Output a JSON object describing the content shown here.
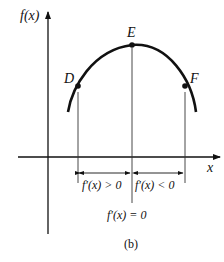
{
  "figure": {
    "caption": "(b)",
    "y_axis_label": "f(x)",
    "x_axis_label": "x",
    "points": [
      {
        "name": "D",
        "label": "D"
      },
      {
        "name": "E",
        "label": "E"
      },
      {
        "name": "F",
        "label": "F"
      }
    ],
    "intervals": {
      "left": "f′(x) > 0",
      "right": "f′(x) < 0"
    },
    "critical_label": "f′(x) = 0",
    "colors": {
      "ink": "#111111",
      "thin": "#333333",
      "background": "#ffffff"
    }
  }
}
